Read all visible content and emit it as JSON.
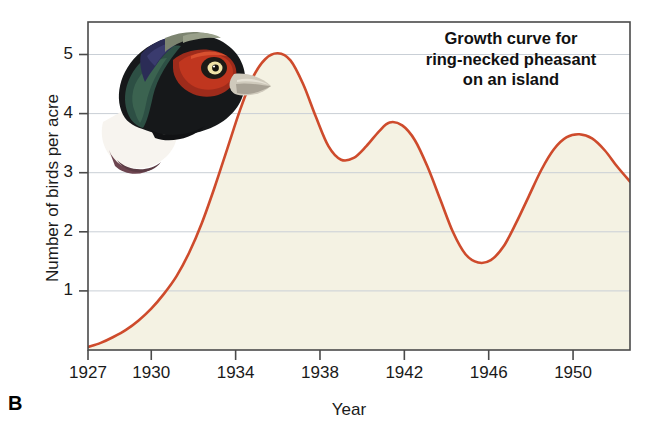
{
  "panel": {
    "letter": "B"
  },
  "chart_data": {
    "type": "line",
    "title": "Growth curve for ring-necked pheasant on an island",
    "title_lines": [
      "Growth curve for",
      "ring-necked pheasant",
      "on an island"
    ],
    "xlabel": "Year",
    "ylabel": "Number of birds per acre",
    "xlim": [
      1927,
      1952.7
    ],
    "ylim": [
      0,
      5.55
    ],
    "xticks": [
      1927,
      1930,
      1934,
      1938,
      1942,
      1946,
      1950
    ],
    "xtick_labels": [
      "1927",
      "1930",
      "1934",
      "1938",
      "1942",
      "1946",
      "1950"
    ],
    "yticks": [
      1,
      2,
      3,
      4,
      5
    ],
    "ytick_labels": [
      "1",
      "2",
      "3",
      "4",
      "5"
    ],
    "grid": "horizontal",
    "legend": "none",
    "fill": true,
    "series": [
      {
        "name": "Ring-necked pheasant population",
        "x": [
          1927.0,
          1927.6,
          1928.2,
          1928.8,
          1929.4,
          1930.0,
          1930.6,
          1931.2,
          1931.8,
          1932.4,
          1933.0,
          1933.6,
          1934.2,
          1934.8,
          1935.4,
          1936.0,
          1936.6,
          1937.2,
          1937.8,
          1938.4,
          1939.0,
          1939.6,
          1940.2,
          1940.8,
          1941.3,
          1941.9,
          1942.5,
          1943.1,
          1943.7,
          1944.3,
          1944.9,
          1945.5,
          1946.1,
          1946.7,
          1947.3,
          1947.9,
          1948.5,
          1949.1,
          1949.7,
          1950.3,
          1950.9,
          1951.5,
          1952.1,
          1952.7
        ],
        "y": [
          0.05,
          0.12,
          0.22,
          0.34,
          0.5,
          0.7,
          0.95,
          1.25,
          1.65,
          2.15,
          2.75,
          3.4,
          4.05,
          4.6,
          4.92,
          5.02,
          4.9,
          4.5,
          3.95,
          3.45,
          3.22,
          3.25,
          3.45,
          3.7,
          3.85,
          3.8,
          3.55,
          3.1,
          2.55,
          2.0,
          1.62,
          1.48,
          1.52,
          1.75,
          2.15,
          2.6,
          3.05,
          3.4,
          3.6,
          3.65,
          3.58,
          3.38,
          3.1,
          2.85
        ]
      }
    ],
    "annotations": [
      {
        "name": "peak-1",
        "year": 1936.0,
        "value": 5.0
      },
      {
        "name": "local-min-1",
        "year": 1939.0,
        "value": 3.2
      },
      {
        "name": "peak-2",
        "year": 1941.3,
        "value": 3.85
      },
      {
        "name": "trough",
        "year": 1945.5,
        "value": 1.48
      },
      {
        "name": "peak-3",
        "year": 1950.3,
        "value": 3.65
      }
    ]
  },
  "colors": {
    "curve": "#CE4B2C",
    "fill": "#F4F2E3",
    "axis": "#4a4a4a",
    "grid": "#c9cfd6",
    "text": "#1a1a1a"
  },
  "illustration": {
    "name": "ring-necked-pheasant-head"
  }
}
